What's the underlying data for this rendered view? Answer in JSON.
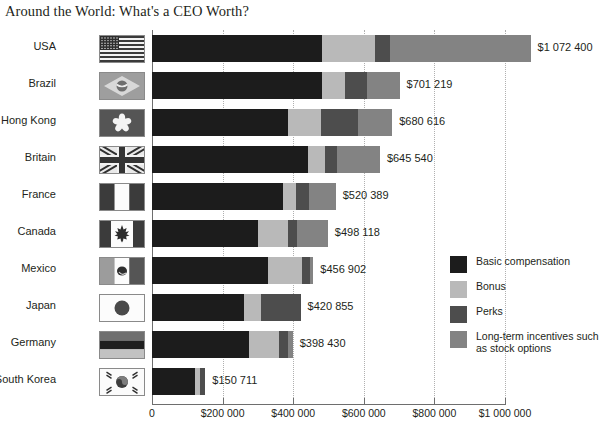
{
  "chart_data": {
    "type": "bar",
    "orientation": "horizontal",
    "stacked": true,
    "title": "Around the World: What's a CEO Worth?",
    "xlabel": "",
    "ylabel": "",
    "xlim": [
      0,
      1100000
    ],
    "grid": true,
    "legend_position": "right-middle",
    "xticks": [
      0,
      200000,
      400000,
      600000,
      800000,
      1000000
    ],
    "xtick_labels": [
      "0",
      "$200 000",
      "$400 000",
      "$600 000",
      "$800 000",
      "$1 000 000"
    ],
    "categories": [
      "USA",
      "Brazil",
      "Hong Kong",
      "Britain",
      "France",
      "Canada",
      "Mexico",
      "Japan",
      "Germany",
      "South Korea"
    ],
    "series": [
      {
        "name": "Basic compensation",
        "color": "#1c1c1c",
        "values": [
          481000,
          481000,
          385000,
          442000,
          372000,
          300000,
          330000,
          260000,
          275000,
          122000
        ]
      },
      {
        "name": "Bonus",
        "color": "#b9b9b9",
        "values": [
          152000,
          66000,
          94000,
          48000,
          36000,
          84000,
          95000,
          48000,
          85000,
          15000
        ]
      },
      {
        "name": "Perks",
        "color": "#4d4d4d",
        "values": [
          42000,
          62000,
          106000,
          34000,
          36000,
          26000,
          22000,
          113000,
          26000,
          14000
        ]
      },
      {
        "name": "Long-term incentives such as stock options",
        "color": "#838383",
        "values": [
          397400,
          92219,
          95616,
          121540,
          76389,
          88118,
          9902,
          0,
          12430,
          0
        ]
      }
    ],
    "totals": [
      1072400,
      701219,
      680616,
      645540,
      520389,
      498118,
      456902,
      420855,
      398430,
      150711
    ],
    "total_labels": [
      "$1 072 400",
      "$701 219",
      "$680 616",
      "$645 540",
      "$520 389",
      "$498 118",
      "$456 902",
      "$420 855",
      "$398 430",
      "$150 711"
    ]
  },
  "legend": {
    "items": [
      {
        "label": "Basic compensation",
        "color": "#1c1c1c"
      },
      {
        "label": "Bonus",
        "color": "#b9b9b9"
      },
      {
        "label": "Perks",
        "color": "#4d4d4d"
      },
      {
        "label": "Long-term incentives such as stock options",
        "color": "#838383"
      }
    ]
  },
  "flags": {
    "USA": "usa-flag-icon",
    "Brazil": "brazil-flag-icon",
    "Hong Kong": "hong-kong-flag-icon",
    "Britain": "britain-flag-icon",
    "France": "france-flag-icon",
    "Canada": "canada-flag-icon",
    "Mexico": "mexico-flag-icon",
    "Japan": "japan-flag-icon",
    "Germany": "germany-flag-icon",
    "South Korea": "south-korea-flag-icon"
  }
}
